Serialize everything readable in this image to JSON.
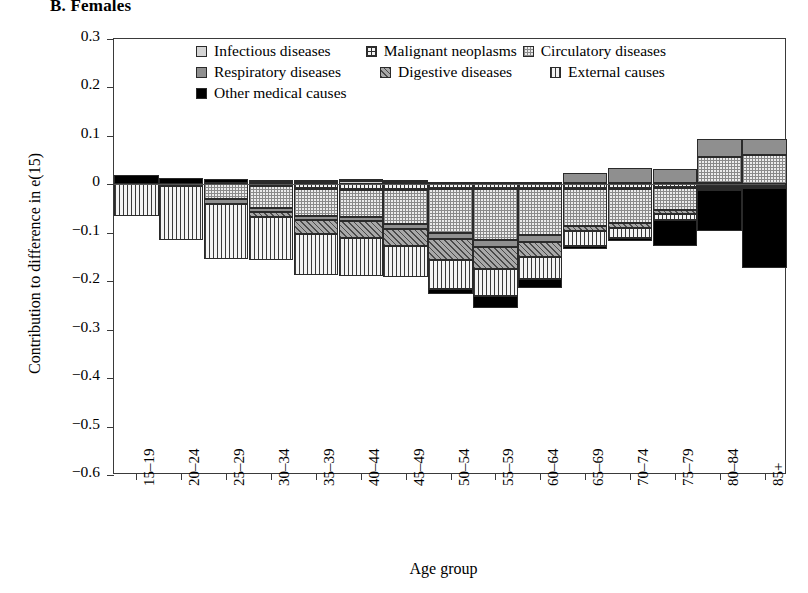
{
  "panel": {
    "title": "B. Females"
  },
  "axes": {
    "ylabel": "Contribution to difference in e(15)",
    "xlabel": "Age group",
    "yticks": [
      "0.3",
      "0.2",
      "0.1",
      "0",
      "−0.1",
      "−0.2",
      "−0.3",
      "−0.4",
      "−0.5",
      "−0.6"
    ],
    "ylim": [
      -0.6,
      0.3
    ]
  },
  "legend": {
    "items": [
      {
        "label": "Infectious diseases",
        "key": "infectious",
        "pattern": "light-gray-solid"
      },
      {
        "label": "Malignant neoplasms",
        "key": "malignant",
        "pattern": "cross-hatch"
      },
      {
        "label": "Circulatory diseases",
        "key": "circulatory",
        "pattern": "fine-stipple"
      },
      {
        "label": "Respiratory diseases",
        "key": "respiratory",
        "pattern": "medium-gray-solid"
      },
      {
        "label": "Digestive diseases",
        "key": "digestive",
        "pattern": "diagonal-hatch"
      },
      {
        "label": "External causes",
        "key": "external",
        "pattern": "vertical-lines"
      },
      {
        "label": "Other medical causes",
        "key": "other",
        "pattern": "black-solid"
      }
    ]
  },
  "chart_data": {
    "type": "bar",
    "title": "B. Females",
    "xlabel": "Age group",
    "ylabel": "Contribution to difference in e(15)",
    "ylim": [
      -0.6,
      0.3
    ],
    "stacked": true,
    "grid": false,
    "legend_position": "top-center",
    "categories": [
      "15–19",
      "20–24",
      "25–29",
      "30–34",
      "35–39",
      "40–44",
      "45–49",
      "50–54",
      "55–59",
      "60–64",
      "65–69",
      "70–74",
      "75–79",
      "80–84",
      "85+"
    ],
    "series": [
      {
        "name": "Infectious diseases",
        "values": [
          0.0,
          0.0,
          0.003,
          0.004,
          0.005,
          0.006,
          0.005,
          0.005,
          0.004,
          0.004,
          0.003,
          0.003,
          0.002,
          0.002,
          0.001
        ]
      },
      {
        "name": "Malignant neoplasms",
        "values": [
          0.0,
          0.0,
          0.0,
          -0.004,
          -0.01,
          -0.012,
          -0.012,
          -0.01,
          -0.01,
          -0.01,
          -0.01,
          -0.01,
          -0.008,
          -0.005,
          -0.004
        ]
      },
      {
        "name": "Circulatory diseases",
        "values": [
          0.0,
          -0.002,
          -0.03,
          -0.045,
          -0.055,
          -0.055,
          -0.07,
          -0.09,
          -0.105,
          -0.095,
          -0.075,
          -0.07,
          -0.045,
          0.055,
          0.06
        ]
      },
      {
        "name": "Respiratory diseases",
        "values": [
          0.0,
          -0.002,
          -0.01,
          -0.008,
          -0.008,
          -0.008,
          -0.01,
          -0.012,
          -0.015,
          -0.015,
          0.02,
          0.03,
          0.03,
          0.037,
          0.033
        ]
      },
      {
        "name": "Digestive diseases",
        "values": [
          0.0,
          0.0,
          0.0,
          -0.01,
          -0.03,
          -0.035,
          -0.035,
          -0.045,
          -0.045,
          -0.03,
          -0.012,
          -0.01,
          -0.008,
          -0.002,
          -0.001
        ]
      },
      {
        "name": "External causes",
        "values": [
          -0.065,
          -0.11,
          -0.115,
          -0.09,
          -0.085,
          -0.08,
          -0.065,
          -0.06,
          -0.055,
          -0.045,
          -0.03,
          -0.02,
          -0.012,
          -0.004,
          -0.002
        ]
      },
      {
        "name": "Other medical causes",
        "values": [
          0.02,
          0.013,
          0.008,
          0.004,
          0.004,
          0.006,
          0.004,
          -0.01,
          -0.025,
          -0.02,
          -0.006,
          -0.008,
          -0.055,
          -0.085,
          -0.165
        ]
      }
    ],
    "bar_tops": [
      0.02,
      0.013,
      0.011,
      0.008,
      0.009,
      0.012,
      0.009,
      0.005,
      0.004,
      0.004,
      0.023,
      0.033,
      0.032,
      0.094,
      0.094
    ],
    "bar_bottoms": [
      -0.065,
      -0.114,
      -0.155,
      -0.157,
      -0.188,
      -0.19,
      -0.192,
      -0.222,
      -0.245,
      -0.2,
      -0.133,
      -0.118,
      -0.128,
      -0.101,
      -0.177
    ]
  }
}
